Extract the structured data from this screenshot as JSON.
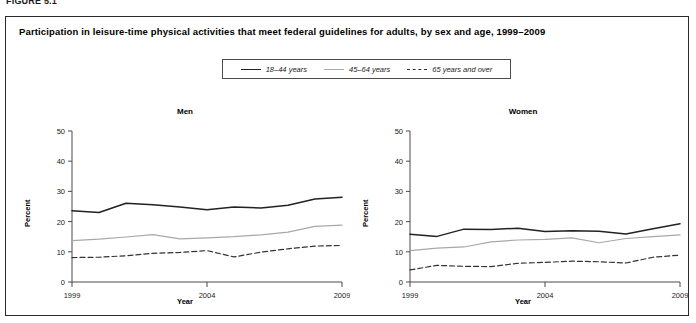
{
  "figure_label": "FIGURE 5.1",
  "figure": {
    "title": "Participation in leisure-time physical activities that meet federal guidelines for adults, by sex and age, 1999–2009"
  },
  "legend": {
    "items": [
      {
        "label": "18–44 years",
        "style": "solid-dark",
        "color": "#222222"
      },
      {
        "label": "45–64 years",
        "style": "solid-light",
        "color": "#a8a8a8"
      },
      {
        "label": "65 years and over",
        "style": "dashed",
        "color": "#333333"
      }
    ]
  },
  "panels": {
    "men": {
      "title": "Men",
      "ylabel": "Percent",
      "xlabel": "Year",
      "ytick_labels": [
        "50",
        "40",
        "30",
        "20",
        "10",
        "0"
      ],
      "xtick_labels": [
        "1999",
        "2004",
        "2009"
      ]
    },
    "women": {
      "title": "Women",
      "ylabel": "Percent",
      "xlabel": "Year",
      "ytick_labels": [
        "50",
        "40",
        "30",
        "20",
        "10",
        "0"
      ],
      "xtick_labels": [
        "1999",
        "2004",
        "2009"
      ]
    }
  },
  "chart_data": [
    {
      "type": "line",
      "title": "Men",
      "xlabel": "Year",
      "ylabel": "Percent",
      "x": [
        1999,
        2000,
        2001,
        2002,
        2003,
        2004,
        2005,
        2006,
        2007,
        2008,
        2009
      ],
      "xlim": [
        1999,
        2009
      ],
      "ylim": [
        0,
        50
      ],
      "yticks": [
        0,
        10,
        20,
        30,
        40,
        50
      ],
      "xticks": [
        1999,
        2004,
        2009
      ],
      "grid": false,
      "legend_position": "top-center-shared",
      "series": [
        {
          "name": "18–44 years",
          "style": "solid",
          "color": "#222222",
          "values": [
            23.6,
            23.0,
            26.1,
            25.6,
            24.8,
            23.9,
            24.8,
            24.5,
            25.4,
            27.5,
            28.1
          ]
        },
        {
          "name": "45–64 years",
          "style": "solid",
          "color": "#a8a8a8",
          "values": [
            13.7,
            14.2,
            14.9,
            15.7,
            14.3,
            14.6,
            15.0,
            15.6,
            16.5,
            18.4,
            18.8
          ]
        },
        {
          "name": "65 years and over",
          "style": "dashed",
          "color": "#333333",
          "values": [
            8.1,
            8.2,
            8.7,
            9.5,
            9.8,
            10.4,
            8.3,
            9.9,
            11.0,
            11.9,
            12.1
          ]
        }
      ]
    },
    {
      "type": "line",
      "title": "Women",
      "xlabel": "Year",
      "ylabel": "Percent",
      "x": [
        1999,
        2000,
        2001,
        2002,
        2003,
        2004,
        2005,
        2006,
        2007,
        2008,
        2009
      ],
      "xlim": [
        1999,
        2009
      ],
      "ylim": [
        0,
        50
      ],
      "yticks": [
        0,
        10,
        20,
        30,
        40,
        50
      ],
      "xticks": [
        1999,
        2004,
        2009
      ],
      "grid": false,
      "legend_position": "top-center-shared",
      "series": [
        {
          "name": "18–44 years",
          "style": "solid",
          "color": "#222222",
          "values": [
            15.8,
            15.1,
            17.5,
            17.4,
            17.8,
            16.7,
            17.0,
            16.8,
            15.9,
            17.6,
            19.3
          ]
        },
        {
          "name": "45–64 years",
          "style": "solid",
          "color": "#a8a8a8",
          "values": [
            10.4,
            11.2,
            11.6,
            13.3,
            13.9,
            14.1,
            14.6,
            13.0,
            14.4,
            15.0,
            15.6
          ]
        },
        {
          "name": "65 years and over",
          "style": "dashed",
          "color": "#333333",
          "values": [
            4.0,
            5.5,
            5.2,
            5.1,
            6.2,
            6.5,
            6.9,
            6.7,
            6.3,
            8.2,
            8.9
          ]
        }
      ]
    }
  ]
}
